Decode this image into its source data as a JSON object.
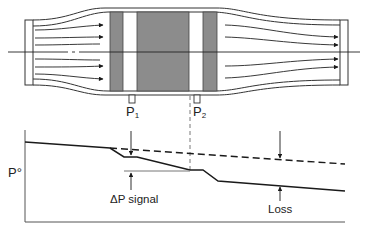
{
  "diagram": {
    "type": "flow-meter-pressure-profile",
    "top": {
      "description": "Flow through pipe with converging inlet, restriction element, diverging outlet",
      "taps": [
        {
          "id": "p1",
          "label": "P",
          "sub": "1"
        },
        {
          "id": "p2",
          "label": "P",
          "sub": "2"
        }
      ]
    },
    "graph": {
      "y_axis_label": "P°",
      "curves": [
        {
          "name": "actual-pressure",
          "style": "solid"
        },
        {
          "name": "pressure-without-meter",
          "style": "dashed"
        }
      ],
      "annotations": {
        "delta_p": "ΔP signal",
        "loss": "Loss"
      }
    },
    "colors": {
      "line": "#1a1a1a",
      "block_fill": "#8c8c8c",
      "pipe_fill": "#ffffff",
      "background": "#ffffff"
    }
  }
}
